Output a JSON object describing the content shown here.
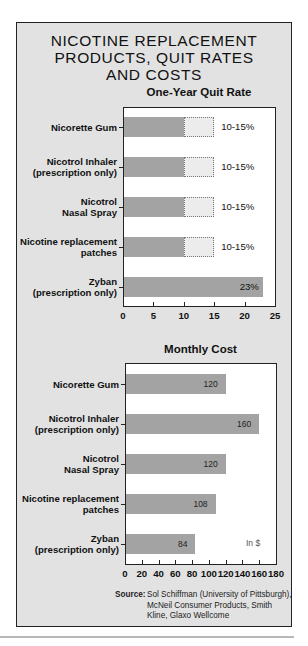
{
  "title_lines": [
    "NICOTINE REPLACEMENT",
    "PRODUCTS, QUIT RATES",
    "AND COSTS"
  ],
  "source_label": "Source",
  "source_lines": [
    "Sol Schiffman (University of Pittsburgh),",
    "McNeil Consumer Products, Smith",
    "Kline, Glaxo Wellcome"
  ],
  "colors": {
    "panel": "#e2e2e2",
    "bar": "#a3a3a3",
    "range": "#ececec",
    "plot": "#ffffff"
  },
  "chart_data": [
    {
      "type": "bar",
      "orientation": "horizontal",
      "title": "One-Year Quit Rate",
      "categories": [
        [
          "Nicorette Gum"
        ],
        [
          "Nicotrol Inhaler",
          "(prescription only)"
        ],
        [
          "Nicotrol",
          "Nasal Spray"
        ],
        [
          "Nicotine replacement",
          "patches"
        ],
        [
          "Zyban",
          "(prescription only)"
        ]
      ],
      "category_names": [
        "Nicorette Gum",
        "Nicotrol Inhaler (prescription only)",
        "Nicotrol Nasal Spray",
        "Nicotine replacement patches",
        "Zyban (prescription only)"
      ],
      "values_low": [
        10,
        10,
        10,
        10,
        23
      ],
      "values_high": [
        15,
        15,
        15,
        15,
        23
      ],
      "data_labels": [
        "10-15%",
        "10-15%",
        "10-15%",
        "10-15%",
        "23%"
      ],
      "xlim": [
        0,
        25
      ],
      "xticks": [
        0,
        5,
        10,
        15,
        20,
        25
      ],
      "xlabel": "",
      "ylabel": "",
      "grid": false,
      "legend": null
    },
    {
      "type": "bar",
      "orientation": "horizontal",
      "title": "Monthly Cost",
      "categories": [
        [
          "Nicorette Gum"
        ],
        [
          "Nicotrol Inhaler",
          "(prescription only)"
        ],
        [
          "Nicotrol",
          "Nasal Spray"
        ],
        [
          "Nicotine replacement",
          "patches"
        ],
        [
          "Zyban",
          "(prescription only)"
        ]
      ],
      "category_names": [
        "Nicorette Gum",
        "Nicotrol Inhaler (prescription only)",
        "Nicotrol Nasal Spray",
        "Nicotine replacement patches",
        "Zyban (prescription only)"
      ],
      "values": [
        120,
        160,
        120,
        108,
        84
      ],
      "data_labels": [
        "120",
        "160",
        "120",
        "108",
        "84"
      ],
      "xlim": [
        0,
        180
      ],
      "xticks": [
        0,
        20,
        40,
        60,
        80,
        100,
        120,
        140,
        160,
        180
      ],
      "unit_label": "In $",
      "xlabel": "",
      "ylabel": "",
      "grid": false,
      "legend": null
    }
  ]
}
